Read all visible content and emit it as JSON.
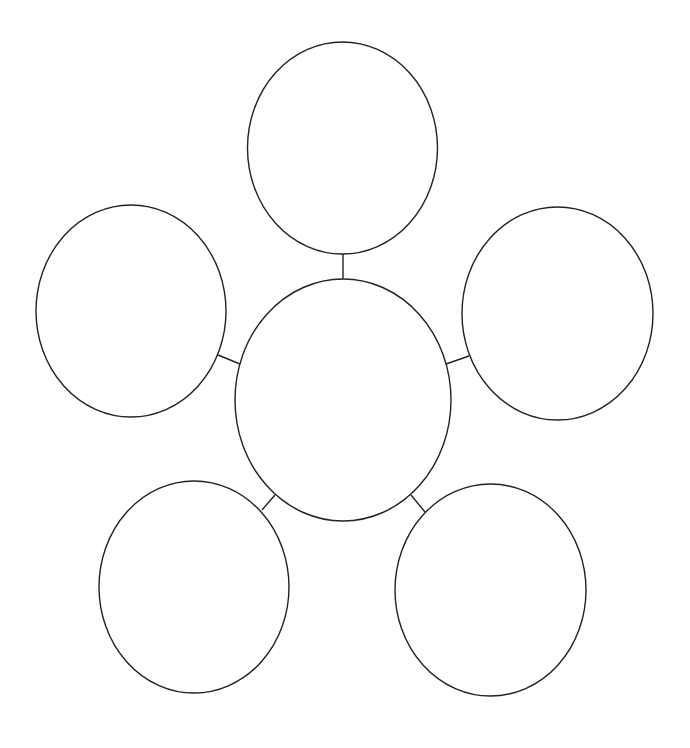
{
  "diagram": {
    "type": "bubble-map",
    "colors": {
      "background": "#ffffff",
      "stroke": "#222222"
    },
    "center": {
      "id": "center",
      "label": "",
      "cx": 343,
      "cy": 400,
      "rx": 108,
      "ry": 121
    },
    "nodes": [
      {
        "id": "top",
        "label": "",
        "cx": 342.5,
        "cy": 148,
        "rx": 95,
        "ry": 106
      },
      {
        "id": "left",
        "label": "",
        "cx": 131,
        "cy": 311,
        "rx": 95,
        "ry": 106
      },
      {
        "id": "right",
        "label": "",
        "cx": 557.5,
        "cy": 313.5,
        "rx": 95.5,
        "ry": 106.5
      },
      {
        "id": "bottom-left",
        "label": "",
        "cx": 194,
        "cy": 587,
        "rx": 95,
        "ry": 106
      },
      {
        "id": "bottom-right",
        "label": "",
        "cx": 490.5,
        "cy": 590,
        "rx": 95.5,
        "ry": 106
      }
    ],
    "connectors": [
      {
        "from": "center",
        "to": "top",
        "x1": 343,
        "y1": 279,
        "x2": 343,
        "y2": 254
      },
      {
        "from": "center",
        "to": "left",
        "x1": 240,
        "y1": 364,
        "x2": 218,
        "y2": 355
      },
      {
        "from": "center",
        "to": "right",
        "x1": 446,
        "y1": 364,
        "x2": 469,
        "y2": 356
      },
      {
        "from": "center",
        "to": "bottom-left",
        "x1": 275,
        "y1": 495,
        "x2": 262,
        "y2": 510
      },
      {
        "from": "center",
        "to": "bottom-right",
        "x1": 411,
        "y1": 495,
        "x2": 425,
        "y2": 512
      }
    ]
  }
}
